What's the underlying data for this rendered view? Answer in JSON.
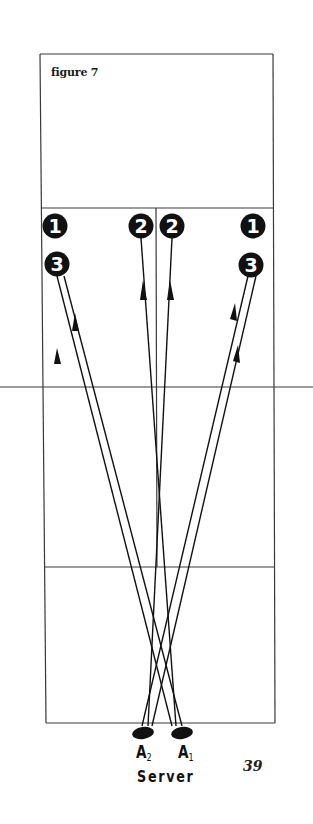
{
  "figure": {
    "title": "figure 7",
    "page_number": "39",
    "caption_labels": {
      "server_left": "A",
      "server_left_sub": "2",
      "server_right": "A",
      "server_right_sub": "1",
      "server_word": "Server"
    }
  },
  "court": {
    "outline": {
      "left": 40,
      "right": 273,
      "top": 54,
      "bottom": 723
    },
    "short_service_line_y": 208,
    "net_y": 387,
    "net_extends": {
      "x1": 0,
      "x2": 313
    },
    "long_service_line_y": 567,
    "center_line": {
      "x": 156,
      "y1": 208,
      "y2": 567
    },
    "line_color": "#333333"
  },
  "targets": [
    {
      "label": "1",
      "x": 55,
      "y": 226,
      "side": "left"
    },
    {
      "label": "3",
      "x": 57,
      "y": 264,
      "side": "left"
    },
    {
      "label": "2",
      "x": 141,
      "y": 226,
      "side": "left-center"
    },
    {
      "label": "2",
      "x": 172,
      "y": 226,
      "side": "right-center"
    },
    {
      "label": "1",
      "x": 253,
      "y": 226,
      "side": "right"
    },
    {
      "label": "3",
      "x": 251,
      "y": 265,
      "side": "right"
    }
  ],
  "servers": [
    {
      "name": "A2",
      "x": 143,
      "y": 730
    },
    {
      "name": "A1",
      "x": 182,
      "y": 730
    }
  ],
  "shot_paths": [
    {
      "from": "A1",
      "to": "left-3",
      "x1": 182,
      "y1": 726,
      "x2": 63,
      "y2": 276,
      "arrow_at": [
        78,
        330
      ]
    },
    {
      "from": "A2",
      "to": "left-3",
      "x1": 146,
      "y1": 726,
      "x2": 55,
      "y2": 276,
      "arrow_at": [
        68,
        340
      ],
      "note": "paired line"
    },
    {
      "from": "A1",
      "to": "left-center-2",
      "x1": 178,
      "y1": 726,
      "x2": 141,
      "y2": 238,
      "arrow_at": [
        143,
        290
      ]
    },
    {
      "from": "A2",
      "to": "right-center-2",
      "x1": 146,
      "y1": 726,
      "x2": 172,
      "y2": 238,
      "arrow_at": [
        170,
        290
      ]
    },
    {
      "from": "A2",
      "to": "right-3",
      "x1": 142,
      "y1": 726,
      "x2": 248,
      "y2": 276,
      "arrow_at": [
        232,
        310
      ]
    },
    {
      "from": "A1",
      "to": "right-3",
      "x1": 180,
      "y1": 726,
      "x2": 256,
      "y2": 276,
      "arrow_at": [
        236,
        350
      ]
    }
  ],
  "colors": {
    "ink": "#111111",
    "background": "#ffffff",
    "court_lines": "#3a3a3a"
  }
}
